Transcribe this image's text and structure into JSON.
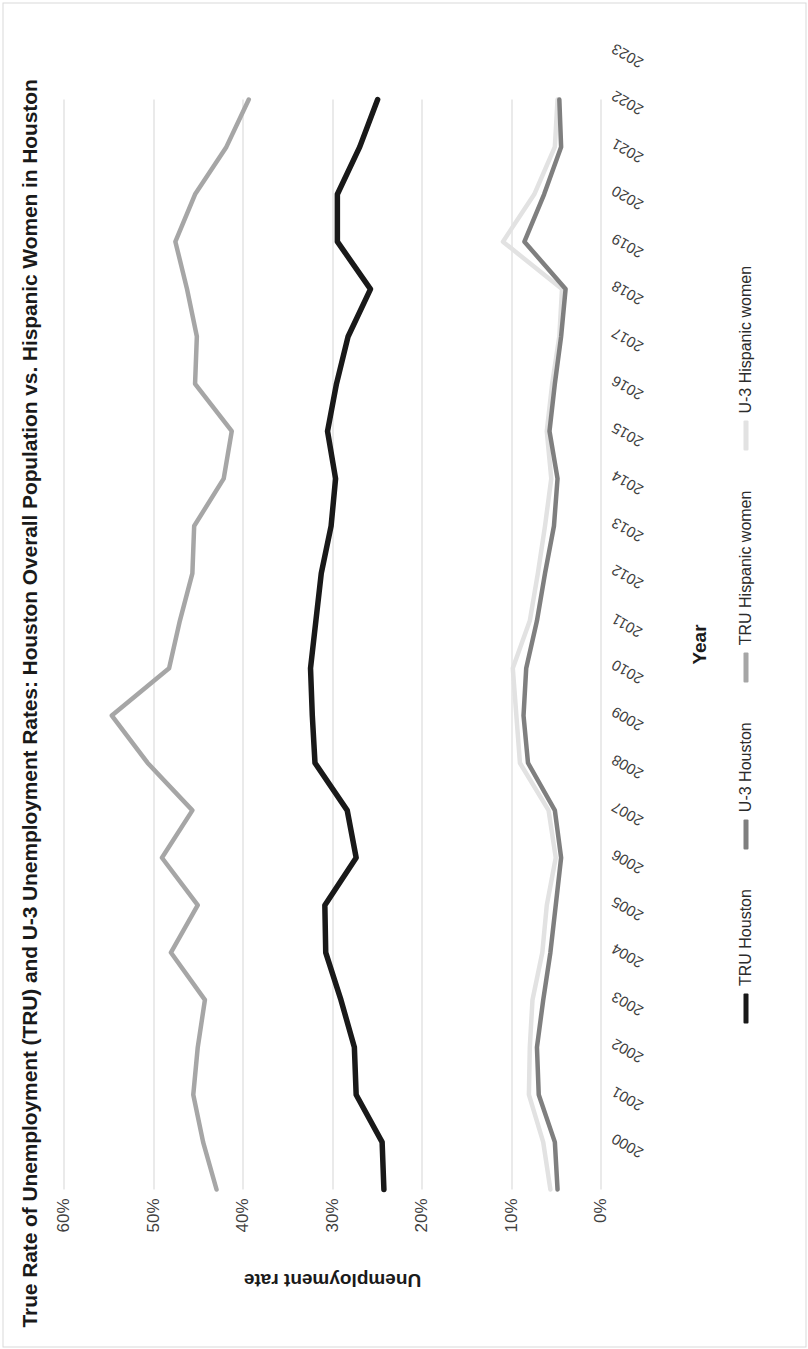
{
  "figure": {
    "title": "True Rate of Unemployment (TRU) and U-3 Unemployment Rates: Houston Overall Population vs. Hispanic Women in Houston",
    "rotation": "page rendered sideways (90°)"
  },
  "axes": {
    "y_title": "Unemployment rate",
    "x_title": "Year",
    "y_ticks": [
      "0%",
      "10%",
      "20%",
      "30%",
      "40%",
      "50%",
      "60%"
    ]
  },
  "colors": {
    "tru_houston": "#191919",
    "u3_houston": "#7f7f7f",
    "tru_hispanic_women": "#a6a6a6",
    "u3_hispanic_women": "#e2e2e2",
    "gridline": "#d5d5d5",
    "text": "#262626"
  },
  "legend": [
    {
      "label": "TRU Houston",
      "color": "#191919"
    },
    {
      "label": "U-3 Houston",
      "color": "#7f7f7f"
    },
    {
      "label": "TRU Hispanic women",
      "color": "#a6a6a6"
    },
    {
      "label": "U-3 Hispanic women",
      "color": "#e2e2e2"
    }
  ],
  "chart_data": {
    "type": "line",
    "title": "True Rate of Unemployment (TRU) and U-3 Unemployment Rates: Houston Overall Population vs. Hispanic Women in Houston",
    "xlabel": "Year",
    "ylabel": "Unemployment rate",
    "ylim": [
      0,
      60
    ],
    "ytick_format": "percent",
    "grid": "horizontal",
    "legend_position": "bottom",
    "x": [
      "2000",
      "2001",
      "2002",
      "2003",
      "2004",
      "2005",
      "2006",
      "2007",
      "2008",
      "2009",
      "2010",
      "2011",
      "2012",
      "2013",
      "2014",
      "2015",
      "2016",
      "2017",
      "2018",
      "2019",
      "2020",
      "2021",
      "2022",
      "2023"
    ],
    "series": [
      {
        "name": "TRU Houston",
        "color": "#191919",
        "values": [
          24.2,
          24.4,
          27.3,
          27.5,
          29.0,
          30.7,
          30.8,
          27.3,
          28.3,
          31.9,
          32.2,
          32.4,
          31.8,
          31.2,
          30.1,
          29.6,
          30.5,
          29.5,
          28.2,
          25.7,
          29.4,
          29.4,
          26.9,
          24.9
        ]
      },
      {
        "name": "U-3 Houston",
        "color": "#7f7f7f",
        "values": [
          4.8,
          5.1,
          6.9,
          7.1,
          6.4,
          5.6,
          5.0,
          4.4,
          5.1,
          8.1,
          8.6,
          8.3,
          7.1,
          6.2,
          5.2,
          4.8,
          5.7,
          5.1,
          4.4,
          3.9,
          8.5,
          6.3,
          4.4,
          4.6
        ]
      },
      {
        "name": "TRU Hispanic women",
        "color": "#a6a6a6",
        "values": [
          42.9,
          44.4,
          45.5,
          45.0,
          44.2,
          48.0,
          45.0,
          49.0,
          45.6,
          50.6,
          54.6,
          48.2,
          47.0,
          45.6,
          45.4,
          42.1,
          41.2,
          45.3,
          45.1,
          46.2,
          47.5,
          45.3,
          41.8,
          39.3
        ]
      },
      {
        "name": "U-3 Hispanic women",
        "color": "#e2e2e2",
        "values": [
          5.6,
          6.4,
          8.0,
          7.9,
          7.6,
          6.5,
          6.0,
          5.0,
          5.8,
          9.0,
          9.4,
          9.8,
          7.9,
          7.0,
          6.2,
          5.5,
          6.0,
          5.4,
          4.6,
          4.3,
          10.9,
          7.4,
          5.1,
          4.8
        ]
      }
    ]
  }
}
